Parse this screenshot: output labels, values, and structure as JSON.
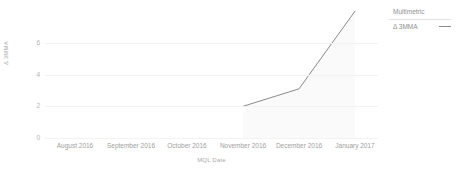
{
  "chart_data": {
    "type": "line",
    "title": "",
    "xlabel": "MQL Date",
    "ylabel": "Δ 3MMA",
    "categories": [
      "August 2016",
      "September 2016",
      "October 2016",
      "November 2016",
      "December 2016",
      "January 2017"
    ],
    "series": [
      {
        "name": "Δ 3MMA",
        "values": [
          null,
          null,
          null,
          2.0,
          3.1,
          8.0
        ]
      }
    ],
    "ytick_labels": [
      "6",
      "4",
      "2",
      "0"
    ],
    "ytick_values": [
      6,
      4,
      2,
      0
    ],
    "ylim": [
      0,
      8.2
    ],
    "grid": true,
    "area_fill": true,
    "legend": {
      "position": "top-right",
      "title": "Multimetric",
      "entries": [
        {
          "label": "Δ 3MMA",
          "marker": "line",
          "color": "#8a8a8a"
        }
      ]
    },
    "colors": {
      "line": "#8a8a8a",
      "area": "#fafafa",
      "grid": "#f2f2f2",
      "text": "#a0a0a0",
      "background": "#ffffff"
    }
  }
}
